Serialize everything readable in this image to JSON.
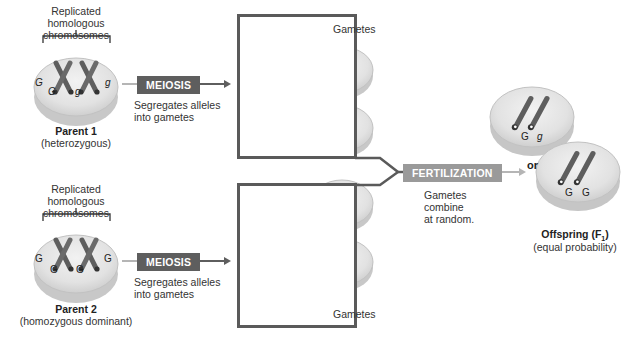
{
  "parent1": {
    "bracket_label_line1": "Replicated",
    "bracket_label_line2": "homologous chromosomes",
    "title": "Parent 1",
    "subtitle": "(heterozygous)",
    "alleles": [
      "G",
      "G",
      "g",
      "g"
    ]
  },
  "parent2": {
    "bracket_label_line1": "Replicated",
    "bracket_label_line2": "homologous chromosomes",
    "title": "Parent 2",
    "subtitle": "(homozygous dominant)",
    "alleles": [
      "G",
      "G",
      "G",
      "G"
    ]
  },
  "meiosis1": {
    "label": "MEIOSIS",
    "caption_line1": "Segregates alleles",
    "caption_line2": "into gametes"
  },
  "meiosis2": {
    "label": "MEIOSIS",
    "caption_line1": "Segregates alleles",
    "caption_line2": "into gametes"
  },
  "gametes1": {
    "label": "Gametes",
    "cells": [
      "G",
      "g",
      "G",
      "g"
    ]
  },
  "gametes2": {
    "label": "Gametes",
    "cells": [
      "G",
      "G",
      "G",
      "G"
    ]
  },
  "fertilization": {
    "label": "FERTILIZATION",
    "caption_line1": "Gametes",
    "caption_line2": "combine",
    "caption_line3": "at random."
  },
  "offspring": {
    "title": "Offspring (F",
    "subscript": "1",
    "title_end": ")",
    "subtitle": "(equal probability)",
    "or_label": "or",
    "option1_alleles": [
      "G",
      "g"
    ],
    "option2_alleles": [
      "G",
      "G"
    ]
  },
  "colors": {
    "box_border": "#5a5a5a",
    "meiosis_bg": "#5e5e5e",
    "fertilization_bg": "#9a9a9a",
    "chromosome": "#6b6b6b",
    "cell_fill": "#e4e4e4"
  }
}
